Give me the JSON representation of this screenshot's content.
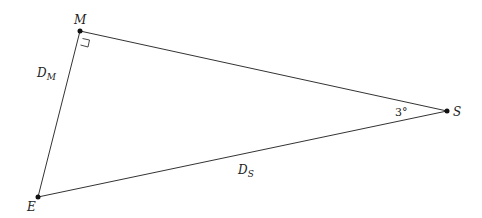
{
  "diagram": {
    "type": "right triangle",
    "points": {
      "M": {
        "label": "M",
        "x": 80,
        "y": 31
      },
      "S": {
        "label": "S",
        "x": 447,
        "y": 111
      },
      "E": {
        "label": "E",
        "x": 38,
        "y": 197
      }
    },
    "sides": {
      "ME": {
        "label": "D",
        "sub": "M"
      },
      "ES": {
        "label": "D",
        "sub": "S"
      }
    },
    "angle_S": "3°",
    "right_angle_at": "M"
  }
}
